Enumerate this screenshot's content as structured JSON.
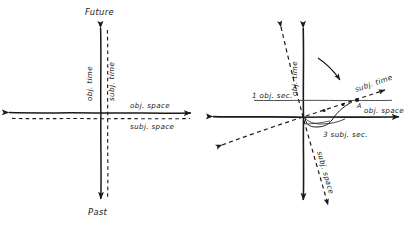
{
  "figure": {
    "background_color": "#ffffff",
    "ink_color": "#1a1a1a"
  },
  "panels": [
    {
      "id": "left-panel",
      "name": "aligned-axes-diagram",
      "description": "Objective and subjective axes coincide",
      "origin": {
        "x": 101,
        "y": 113
      },
      "labels": {
        "future": "Future",
        "past": "Past",
        "obj_time": "obj. time",
        "subj_time": "subj. time",
        "obj_space": "obj. space",
        "subj_space": "subj. space"
      },
      "axes": [
        {
          "name": "obj-time-axis",
          "style": "solid",
          "orientation": "vertical",
          "arrows": "both"
        },
        {
          "name": "subj-time-axis",
          "style": "dashed",
          "orientation": "vertical",
          "arrows": "both"
        },
        {
          "name": "obj-space-axis",
          "style": "solid",
          "orientation": "horizontal",
          "arrows": "both"
        },
        {
          "name": "subj-space-axis",
          "style": "dashed",
          "orientation": "horizontal",
          "arrows": "both"
        }
      ]
    },
    {
      "id": "right-panel",
      "name": "rotated-axes-diagram",
      "description": "Subjective axes rotated relative to objective axes",
      "origin": {
        "x": 303,
        "y": 117
      },
      "labels": {
        "obj_time": "obj. time",
        "obj_space": "obj. space",
        "subj_time": "subj. time",
        "subj_space": "subj. space",
        "one_obj_sec": "1 obj. sec.",
        "three_subj_sec": "3 subj. sec.",
        "point_a": "A"
      },
      "axes": [
        {
          "name": "obj-time-axis",
          "style": "solid",
          "orientation": "vertical",
          "arrows": "both"
        },
        {
          "name": "obj-space-axis",
          "style": "solid",
          "orientation": "horizontal",
          "arrows": "both"
        },
        {
          "name": "subj-time-axis",
          "style": "dashed",
          "orientation": "diagonal-up-right",
          "arrows": "both"
        },
        {
          "name": "subj-space-axis",
          "style": "dashed",
          "orientation": "diagonal-down-right",
          "arrows": "both"
        }
      ],
      "annotations": [
        {
          "name": "rotation-arrow",
          "kind": "curved-arrow",
          "meaning": "rotation of axes"
        },
        {
          "name": "one-obj-sec-line",
          "kind": "horizontal-reference-line",
          "value": "1 obj. sec."
        },
        {
          "name": "three-subj-sec-brace",
          "kind": "brace",
          "value": "3 subj. sec."
        },
        {
          "name": "tick-dots",
          "kind": "dots",
          "count": 3,
          "meaning": "subjective second ticks along subj. time"
        },
        {
          "name": "event-point-a",
          "kind": "point",
          "label": "A"
        }
      ]
    }
  ]
}
